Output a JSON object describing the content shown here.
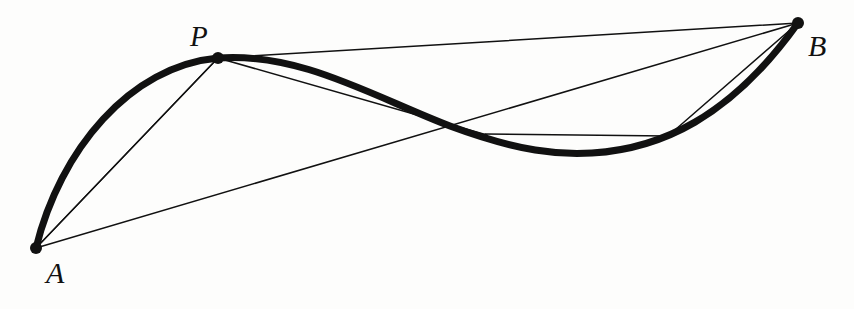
{
  "figure": {
    "background_color": "#fdfdfc",
    "stroke_color": "#111111",
    "width": 854,
    "height": 309,
    "points": [
      {
        "id": "A",
        "label": "A",
        "x": 36,
        "y": 248,
        "marker": "filled-dot",
        "radius": 6
      },
      {
        "id": "P",
        "label": "P",
        "x": 218,
        "y": 58,
        "marker": "filled-dot",
        "radius": 6
      },
      {
        "id": "B",
        "label": "B",
        "x": 798,
        "y": 23,
        "marker": "filled-dot",
        "radius": 6
      }
    ],
    "thick_curve": {
      "name": "main-spline",
      "stroke_width": 7,
      "path": "M 36 248 C 60 150 130 66 218 58 C 300 52 372 96 450 126 C 520 152 560 155 592 153 C 660 149 730 118 798 23"
    },
    "thin_lines": [
      {
        "name": "chord-a-p",
        "x1": 36,
        "y1": 248,
        "x2": 218,
        "y2": 58,
        "stroke_width": 1.5
      },
      {
        "name": "chord-a-p-inner",
        "x1": 36,
        "y1": 248,
        "x2": 214,
        "y2": 62,
        "stroke_width": 1.2
      },
      {
        "name": "chord-a-b",
        "x1": 36,
        "y1": 248,
        "x2": 798,
        "y2": 23,
        "stroke_width": 1.5
      },
      {
        "name": "chord-p-b",
        "x1": 218,
        "y1": 58,
        "x2": 798,
        "y2": 23,
        "stroke_width": 1.5
      },
      {
        "name": "chord-p-q",
        "x1": 218,
        "y1": 58,
        "x2": 487,
        "y2": 135,
        "stroke_width": 1.5
      },
      {
        "name": "chord-q-r",
        "x1": 485,
        "y1": 134,
        "x2": 668,
        "y2": 136,
        "stroke_width": 1.3
      },
      {
        "name": "chord-r-b",
        "x1": 668,
        "y1": 136,
        "x2": 798,
        "y2": 23,
        "stroke_width": 1.5
      }
    ],
    "labels": {
      "A": "A",
      "P": "P",
      "B": "B"
    }
  },
  "chart_data": {
    "type": "line",
    "title": "",
    "xlabel": "",
    "ylabel": "",
    "xlim": [
      0,
      854
    ],
    "ylim": [
      309,
      0
    ],
    "grid": false,
    "legend": null,
    "annotations": [
      {
        "text": "A",
        "x": 36,
        "y": 248
      },
      {
        "text": "P",
        "x": 218,
        "y": 58
      },
      {
        "text": "B",
        "x": 798,
        "y": 23
      }
    ],
    "series": [
      {
        "name": "thick-curve",
        "x": [
          36,
          80,
          130,
          175,
          218,
          260,
          310,
          360,
          410,
          450,
          500,
          545,
          590,
          635,
          680,
          720,
          760,
          798
        ],
        "y": [
          248,
          150,
          92,
          66,
          58,
          57,
          66,
          82,
          104,
          126,
          142,
          150,
          153,
          151,
          143,
          128,
          96,
          23
        ]
      },
      {
        "name": "chord-A-P",
        "x": [
          36,
          218
        ],
        "y": [
          248,
          58
        ]
      },
      {
        "name": "chord-A-B",
        "x": [
          36,
          798
        ],
        "y": [
          248,
          23
        ]
      },
      {
        "name": "chord-P-B",
        "x": [
          218,
          798
        ],
        "y": [
          58,
          23
        ]
      },
      {
        "name": "chord-P-Q",
        "x": [
          218,
          487
        ],
        "y": [
          58,
          135
        ]
      },
      {
        "name": "chord-Q-R",
        "x": [
          485,
          668
        ],
        "y": [
          134,
          136
        ]
      },
      {
        "name": "chord-R-B",
        "x": [
          668,
          798
        ],
        "y": [
          136,
          23
        ]
      }
    ]
  }
}
